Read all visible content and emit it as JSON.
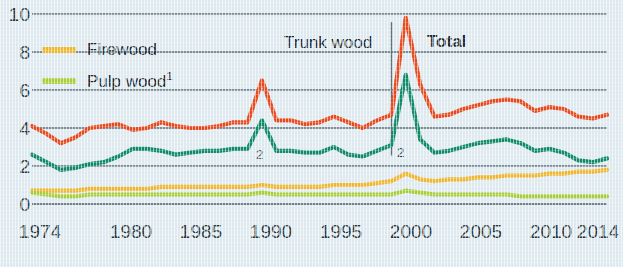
{
  "chart_data": {
    "type": "line",
    "title": "",
    "subtitle": "",
    "xlabel": "",
    "ylabel": "",
    "xlim": [
      1974,
      2014
    ],
    "ylim": [
      0,
      10
    ],
    "yticks": [
      0,
      2,
      4,
      6,
      8,
      10
    ],
    "xticks": [
      1974,
      1980,
      1985,
      1990,
      1995,
      2000,
      2005,
      2010,
      2014
    ],
    "grid": true,
    "legend_position": "top-left",
    "x": [
      1974,
      1975,
      1976,
      1977,
      1978,
      1979,
      1980,
      1981,
      1982,
      1983,
      1984,
      1985,
      1986,
      1987,
      1988,
      1989,
      1990,
      1991,
      1992,
      1993,
      1994,
      1995,
      1996,
      1997,
      1998,
      1999,
      2000,
      2001,
      2002,
      2003,
      2004,
      2005,
      2006,
      2007,
      2008,
      2009,
      2010,
      2011,
      2012,
      2013,
      2014
    ],
    "series": [
      {
        "name": "Total",
        "color": "#E8491C",
        "values": [
          4.1,
          3.7,
          3.2,
          3.5,
          4.0,
          4.1,
          4.2,
          3.9,
          4.0,
          4.3,
          4.1,
          4.0,
          4.0,
          4.1,
          4.3,
          4.3,
          6.5,
          4.4,
          4.4,
          4.2,
          4.3,
          4.6,
          4.3,
          4.0,
          4.4,
          4.7,
          9.8,
          6.3,
          4.6,
          4.7,
          5.0,
          5.2,
          5.4,
          5.5,
          5.4,
          4.9,
          5.1,
          5.0,
          4.6,
          4.5,
          4.7
        ]
      },
      {
        "name": "Trunk wood",
        "color": "#0F8A66",
        "values": [
          2.6,
          2.2,
          1.8,
          1.9,
          2.1,
          2.2,
          2.5,
          2.9,
          2.9,
          2.8,
          2.6,
          2.7,
          2.8,
          2.8,
          2.9,
          2.9,
          4.4,
          2.8,
          2.8,
          2.7,
          2.7,
          3.0,
          2.6,
          2.5,
          2.8,
          3.1,
          6.8,
          3.4,
          2.7,
          2.8,
          3.0,
          3.2,
          3.3,
          3.4,
          3.2,
          2.8,
          2.9,
          2.7,
          2.3,
          2.2,
          2.4
        ]
      },
      {
        "name": "Firewood",
        "color": "#EFB52B",
        "values": [
          0.7,
          0.7,
          0.7,
          0.7,
          0.8,
          0.8,
          0.8,
          0.8,
          0.8,
          0.9,
          0.9,
          0.9,
          0.9,
          0.9,
          0.9,
          0.9,
          1.0,
          0.9,
          0.9,
          0.9,
          0.9,
          1.0,
          1.0,
          1.0,
          1.1,
          1.2,
          1.6,
          1.3,
          1.2,
          1.3,
          1.3,
          1.4,
          1.4,
          1.5,
          1.5,
          1.5,
          1.6,
          1.6,
          1.7,
          1.7,
          1.8
        ]
      },
      {
        "name": "Pulp wood",
        "color": "#A6CE39",
        "values": [
          0.6,
          0.5,
          0.4,
          0.4,
          0.5,
          0.5,
          0.5,
          0.5,
          0.5,
          0.5,
          0.5,
          0.5,
          0.5,
          0.5,
          0.5,
          0.5,
          0.6,
          0.5,
          0.5,
          0.5,
          0.5,
          0.5,
          0.5,
          0.5,
          0.5,
          0.5,
          0.7,
          0.6,
          0.5,
          0.5,
          0.5,
          0.5,
          0.5,
          0.5,
          0.4,
          0.4,
          0.4,
          0.4,
          0.4,
          0.4,
          0.4
        ]
      }
    ],
    "annotations": [
      {
        "text": "2",
        "x": 1991,
        "y": 2.55
      },
      {
        "text": "2",
        "x": 2001,
        "y": 2.6
      }
    ],
    "divider_x": 1999
  },
  "legend": {
    "items": [
      {
        "label": "Firewood",
        "sup": "",
        "color": "#EFB52B"
      },
      {
        "label": "Pulp wood",
        "sup": "1",
        "color": "#A6CE39"
      }
    ]
  },
  "band_labels": {
    "trunk_wood": "Trunk wood",
    "total": "Total"
  }
}
